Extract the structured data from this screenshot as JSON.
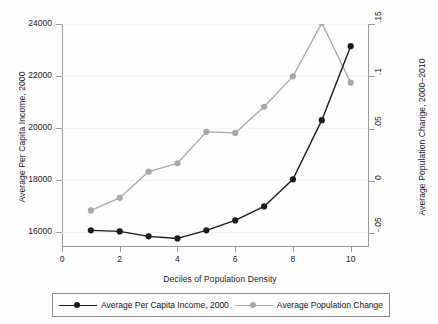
{
  "chart_data": {
    "type": "line",
    "title": "",
    "xlabel": "Deciles of Population Density",
    "ylabel": "Average Per Capita Income, 2000",
    "ylabel_right": "Average Population Change, 2000-2010",
    "x": [
      1,
      2,
      3,
      4,
      5,
      6,
      7,
      8,
      9,
      10
    ],
    "xlim": [
      0,
      10.6
    ],
    "xticks": [
      "0",
      "2",
      "4",
      "6",
      "8",
      "10"
    ],
    "xtick_values": [
      0,
      2,
      4,
      6,
      8,
      10
    ],
    "ylim": [
      15480,
      24000
    ],
    "yticks": [
      "16000",
      "18000",
      "20000",
      "22000",
      "24000"
    ],
    "ytick_values": [
      16000,
      18000,
      20000,
      22000,
      24000
    ],
    "ylim_right": [
      -0.062,
      0.15
    ],
    "yticks_right": [
      "-.05",
      "0",
      ".05",
      ".1",
      ".15"
    ],
    "ytick_values_right": [
      -0.05,
      0,
      0.05,
      0.1,
      0.15
    ],
    "grid": "horizontal-faint",
    "legend_position": "below",
    "series": [
      {
        "name": "Average Per Capita Income, 2000",
        "axis": "left",
        "color": "#1a1a1a",
        "marker": "circle",
        "values": [
          16080,
          16040,
          15850,
          15770,
          16080,
          16460,
          17000,
          18040,
          20310,
          23150
        ]
      },
      {
        "name": "Average Population Change",
        "axis": "right",
        "color": "#a8a8a8",
        "marker": "circle",
        "values": [
          -0.028,
          -0.016,
          0.009,
          0.017,
          0.047,
          0.046,
          0.071,
          0.1,
          0.151,
          0.094
        ]
      }
    ]
  },
  "axes": {
    "x_title": "Deciles of Population Density",
    "y_left_title": "Average Per Capita Income, 2000",
    "y_right_title": "Average Population Change, 2000–2010"
  },
  "legend": {
    "items": [
      {
        "label": "Average Per Capita Income, 2000",
        "color": "#1a1a1a"
      },
      {
        "label": "Average Population Change",
        "color": "#a8a8a8"
      }
    ]
  }
}
